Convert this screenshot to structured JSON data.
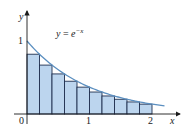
{
  "chart_data": {
    "type": "area",
    "title": "",
    "function_label": "y = e^{-x}",
    "function_label_parts": {
      "lhs": "y",
      "eq": " = ",
      "base": "e",
      "exp": "−x"
    },
    "xlabel": "x",
    "ylabel": "y",
    "xlim": [
      0,
      2.4
    ],
    "ylim": [
      0,
      1.3
    ],
    "x_ticks": [
      {
        "value": 0,
        "label": "0"
      },
      {
        "value": 1,
        "label": "1"
      },
      {
        "value": 2,
        "label": "2"
      }
    ],
    "y_ticks": [
      {
        "value": 1,
        "label": "1"
      }
    ],
    "grid": false,
    "legend": null,
    "approximation": "right-endpoint Riemann sum",
    "n_rectangles": 10,
    "rect_width": 0.2,
    "rectangles": [
      {
        "x0": 0.0,
        "x1": 0.2,
        "height": 0.819
      },
      {
        "x0": 0.2,
        "x1": 0.4,
        "height": 0.67
      },
      {
        "x0": 0.4,
        "x1": 0.6,
        "height": 0.549
      },
      {
        "x0": 0.6,
        "x1": 0.8,
        "height": 0.449
      },
      {
        "x0": 0.8,
        "x1": 1.0,
        "height": 0.368
      },
      {
        "x0": 1.0,
        "x1": 1.2,
        "height": 0.301
      },
      {
        "x0": 1.2,
        "x1": 1.4,
        "height": 0.247
      },
      {
        "x0": 1.4,
        "x1": 1.6,
        "height": 0.202
      },
      {
        "x0": 1.6,
        "x1": 1.8,
        "height": 0.165
      },
      {
        "x0": 1.8,
        "x1": 2.0,
        "height": 0.135
      }
    ],
    "curve": {
      "expr": "exp(-x)",
      "x_start": 0,
      "x_end": 2.2
    },
    "colors": {
      "rect_fill": "#bcd5ee",
      "rect_stroke": "#1f2f4f",
      "curve": "#5b8fc0",
      "axis": "#1a1a1a"
    }
  }
}
